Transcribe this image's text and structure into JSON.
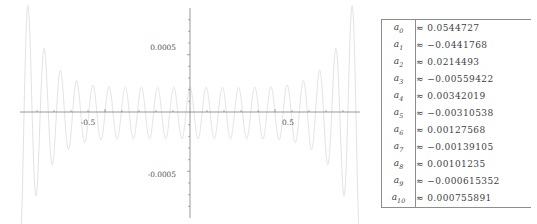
{
  "figure": {
    "name": "approximation-error-plot",
    "curve_color": "#d9d9d9",
    "axis_color": "#6e6e6e",
    "x_axis": {
      "min": -1.0,
      "max": 1.0,
      "tick_labels": [
        "-0.5",
        "0.5"
      ],
      "tick_values": [
        -0.5,
        0.5
      ]
    },
    "y_axis": {
      "min": -0.0009,
      "max": 0.0009,
      "tick_labels": [
        "0.0005",
        "-0.0005"
      ],
      "tick_values": [
        0.0005,
        -0.0005
      ]
    }
  },
  "chart_data": {
    "type": "line",
    "title": "",
    "subtitle": "",
    "xlabel": "",
    "ylabel": "",
    "grid": false,
    "legend": "none",
    "xlim": [
      -1.0,
      1.0
    ],
    "ylim": [
      -0.0009,
      0.0009
    ],
    "xticks": [
      -0.5,
      0.5
    ],
    "xticklabels": [
      "-0.5",
      "0.5"
    ],
    "yticks": [
      0.0005,
      -0.0005
    ],
    "yticklabels": [
      "0.0005",
      "-0.0005"
    ],
    "series": [
      {
        "name": "error",
        "color": "#d9d9d9",
        "oscillation_count": 21,
        "envelope_center": 0.00022,
        "envelope_edge": 0.0012,
        "envelope_exponent": 7
      }
    ]
  },
  "table": {
    "name": "coefficient-table",
    "columns": [
      "index",
      "value"
    ],
    "rows": [
      {
        "index": "a",
        "sub": "0",
        "value": "≈ 0.0544727"
      },
      {
        "index": "a",
        "sub": "1",
        "value": "≈ −0.0441768"
      },
      {
        "index": "a",
        "sub": "2",
        "value": "≈ 0.0214493"
      },
      {
        "index": "a",
        "sub": "3",
        "value": "≈ −0.00559422"
      },
      {
        "index": "a",
        "sub": "4",
        "value": "≈ 0.00342019"
      },
      {
        "index": "a",
        "sub": "5",
        "value": "≈ −0.00310538"
      },
      {
        "index": "a",
        "sub": "6",
        "value": "≈ 0.00127568"
      },
      {
        "index": "a",
        "sub": "7",
        "value": "≈ −0.00139105"
      },
      {
        "index": "a",
        "sub": "8",
        "value": "≈ 0.00101235"
      },
      {
        "index": "a",
        "sub": "9",
        "value": "≈ −0.000615352"
      },
      {
        "index": "a",
        "sub": "10",
        "value": "≈ 0.000755891"
      }
    ]
  }
}
